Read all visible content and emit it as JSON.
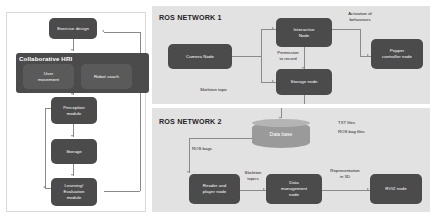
{
  "diagram": {
    "colors": {
      "node_fill": "#4b4b4b",
      "node_fill_inner": "#5a5a5a",
      "node_fill_blue": "#3f4f63",
      "panel_bg": "#e2e2e2",
      "database_fill": "#9a9a9a",
      "connector": "#8a8a8a",
      "node_text": "#ffffff",
      "label_text": "#1a1a1a"
    }
  },
  "left_panel": {
    "nodes": [
      {
        "id": "exercise-design",
        "label": "Exercise design"
      },
      {
        "id": "user-movement",
        "label": "User\nmovement"
      },
      {
        "id": "robot-coach",
        "label": "Robot coach"
      },
      {
        "id": "perception-module",
        "label": "Perception\nmodule"
      },
      {
        "id": "storage",
        "label": "Storage"
      },
      {
        "id": "learning-evaluation-module",
        "label": "Learning/\nEvaluation\nmodule"
      }
    ],
    "group_title": "Collaborative HRI"
  },
  "ros_network_1": {
    "title": "ROS NETWORK 1",
    "nodes": [
      {
        "id": "camera-node",
        "label": "Camera Node"
      },
      {
        "id": "interactive-node",
        "label": "Interactive\nNode"
      },
      {
        "id": "storage-node",
        "label": "Storage node"
      },
      {
        "id": "pepper-controller-node",
        "label": "Pepper\ncontroller node"
      }
    ],
    "labels": [
      {
        "id": "activation-of-behaviours",
        "text": "Activation of\nbehaviours"
      },
      {
        "id": "permission-to-record",
        "text": "Permission\nto record"
      },
      {
        "id": "skeleton-topic",
        "text": "Skeleton topic"
      }
    ]
  },
  "ros_network_2": {
    "title": "ROS NETWORK 2",
    "database": {
      "id": "data-base",
      "label": "Data base"
    },
    "nodes": [
      {
        "id": "reader-and-player-node",
        "label": "Reader and\nplayer node"
      },
      {
        "id": "data-management-node",
        "label": "Data\nmanagement\nnode"
      },
      {
        "id": "rviz-node",
        "label": "RVIZ node"
      }
    ],
    "labels": [
      {
        "id": "txt-files",
        "text": "TXT files"
      },
      {
        "id": "ros-bag-files",
        "text": "ROS bag files"
      },
      {
        "id": "ros-bags",
        "text": "ROS bags"
      },
      {
        "id": "skeleton-topics",
        "text": "Skeleton\ntopics"
      },
      {
        "id": "representation-in-3d",
        "text": "Representation\nin 3D"
      }
    ]
  }
}
